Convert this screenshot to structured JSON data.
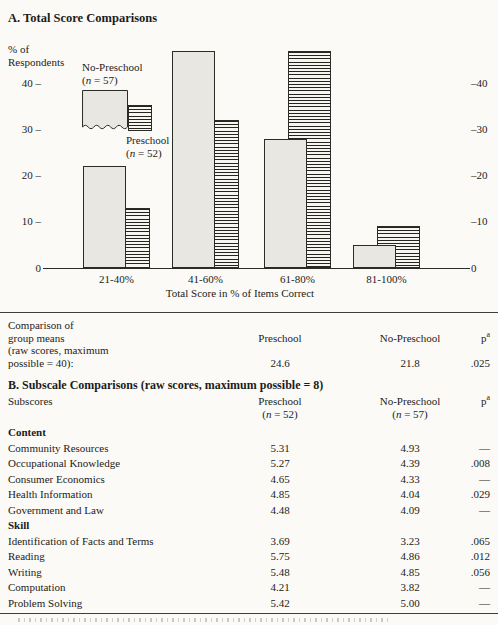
{
  "section_a": {
    "title": "A. Total Score Comparisons",
    "y_axis_label_lines": [
      "% of",
      "Respondents"
    ],
    "x_axis_title": "Total Score in % of Items Correct",
    "legend": {
      "no_preschool_line1": "No-Preschool",
      "no_preschool_line2": "(n = 57)",
      "preschool_line1": "Preschool",
      "preschool_line2": "(n = 52)"
    }
  },
  "chart_data": {
    "type": "bar",
    "title": "A. Total Score Comparisons",
    "categories": [
      "21-40%",
      "41-60%",
      "61-80%",
      "81-100%"
    ],
    "series": [
      {
        "name": "No-Preschool (n = 57)",
        "style": "solid-gray",
        "values": [
          22,
          47,
          28,
          5
        ]
      },
      {
        "name": "Preschool (n = 52)",
        "style": "horizontal-stripes",
        "values": [
          13,
          32,
          47,
          9
        ]
      }
    ],
    "xlabel": "Total Score in % of Items Correct",
    "ylabel": "% of Respondents",
    "ylim": [
      0,
      48
    ],
    "y_ticks_left": [
      40,
      30,
      20,
      10,
      0
    ],
    "y_ticks_right": [
      40,
      30,
      20,
      10,
      0
    ],
    "grid": false,
    "legend_position": "upper-left"
  },
  "table_a": {
    "label_line1": "Comparison of",
    "label_line2": "group means",
    "label_line3": "(raw scores, maximum",
    "label_line4": "possible = 40):",
    "col_preschool": "Preschool",
    "col_no_preschool": "No-Preschool",
    "p_base": "p",
    "p_sup": "a",
    "value_preschool": "24.6",
    "value_no_preschool": "21.8",
    "value_p": ".025"
  },
  "section_b": {
    "title": "B. Subscale Comparisons (raw scores, maximum possible = 8)",
    "header": {
      "label": "Subscores",
      "preschool_line1": "Preschool",
      "preschool_line2": "(n = 52)",
      "no_preschool_line1": "No-Preschool",
      "no_preschool_line2": "(n = 57)",
      "p_base": "p",
      "p_sup": "a"
    },
    "groups": [
      {
        "name": "Content",
        "rows": [
          {
            "label": "Community Resources",
            "preschool": "5.31",
            "no_preschool": "4.93",
            "p": "—"
          },
          {
            "label": "Occupational Knowledge",
            "preschool": "5.27",
            "no_preschool": "4.39",
            "p": ".008"
          },
          {
            "label": "Consumer Economics",
            "preschool": "4.65",
            "no_preschool": "4.33",
            "p": "—"
          },
          {
            "label": "Health Information",
            "preschool": "4.85",
            "no_preschool": "4.04",
            "p": ".029"
          },
          {
            "label": "Government and Law",
            "preschool": "4.48",
            "no_preschool": "4.09",
            "p": "—"
          }
        ]
      },
      {
        "name": "Skill",
        "rows": [
          {
            "label": "Identification of Facts and Terms",
            "preschool": "3.69",
            "no_preschool": "3.23",
            "p": ".065"
          },
          {
            "label": "Reading",
            "preschool": "5.75",
            "no_preschool": "4.86",
            "p": ".012"
          },
          {
            "label": "Writing",
            "preschool": "5.48",
            "no_preschool": "4.85",
            "p": ".056"
          },
          {
            "label": "Computation",
            "preschool": "4.21",
            "no_preschool": "3.82",
            "p": "—"
          },
          {
            "label": "Problem Solving",
            "preschool": "5.42",
            "no_preschool": "5.00",
            "p": "—"
          }
        ]
      }
    ]
  }
}
